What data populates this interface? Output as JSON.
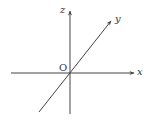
{
  "diagram": {
    "origin_label": "O",
    "axes": [
      {
        "name": "x",
        "label": "x"
      },
      {
        "name": "y",
        "label": "y"
      },
      {
        "name": "z",
        "label": "z"
      }
    ],
    "colors": {
      "line": "#444444",
      "background": "#ffffff"
    }
  }
}
